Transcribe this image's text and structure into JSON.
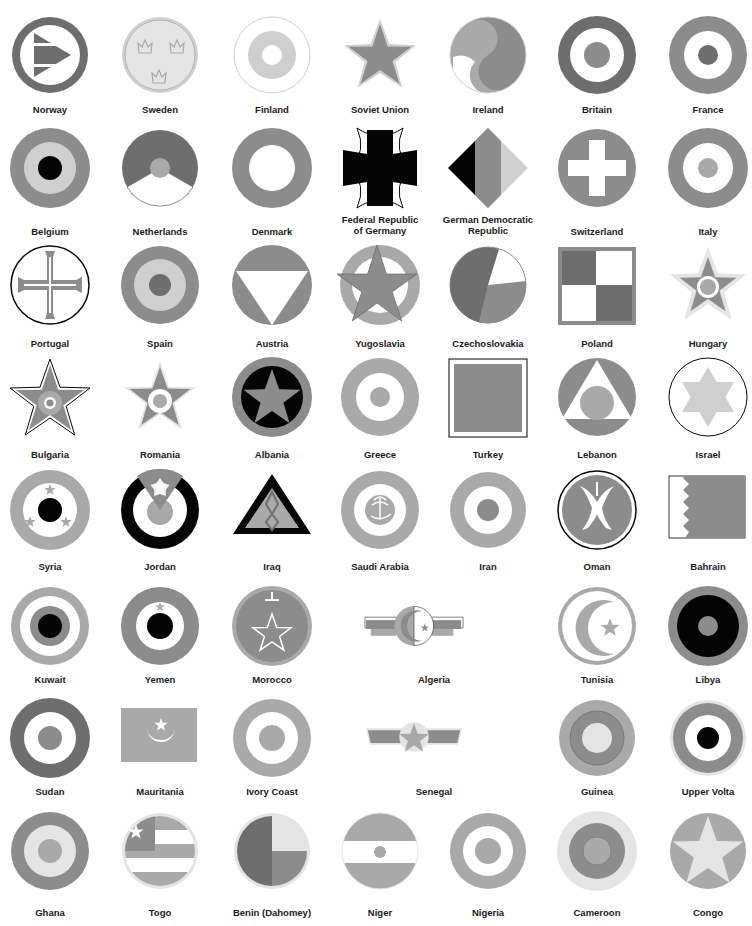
{
  "colors": {
    "dark": "#6e6e6e",
    "mid": "#8c8c8c",
    "light": "#a9a9a9",
    "pale": "#cfcfcf",
    "faint": "#e4e4e4",
    "black": "#050505",
    "white": "#ffffff"
  },
  "roundels": [
    {
      "row": 0,
      "col": 0,
      "label": "Norway",
      "shape": "norway"
    },
    {
      "row": 0,
      "col": 1,
      "label": "Sweden",
      "shape": "sweden"
    },
    {
      "row": 0,
      "col": 2,
      "label": "Finland",
      "shape": "finland"
    },
    {
      "row": 0,
      "col": 3,
      "label": "Soviet Union",
      "shape": "soviet"
    },
    {
      "row": 0,
      "col": 4,
      "label": "Ireland",
      "shape": "ireland"
    },
    {
      "row": 0,
      "col": 5,
      "label": "Britain",
      "shape": "britain"
    },
    {
      "row": 0,
      "col": 6,
      "label": "France",
      "shape": "france"
    },
    {
      "row": 1,
      "col": 0,
      "label": "Belgium",
      "shape": "belgium"
    },
    {
      "row": 1,
      "col": 1,
      "label": "Netherlands",
      "shape": "netherlands"
    },
    {
      "row": 1,
      "col": 2,
      "label": "Denmark",
      "shape": "denmark"
    },
    {
      "row": 1,
      "col": 3,
      "label": "Federal Republic\nof Germany",
      "shape": "frg"
    },
    {
      "row": 1,
      "col": 4,
      "label": "German Democratic\nRepublic",
      "shape": "gdr"
    },
    {
      "row": 1,
      "col": 5,
      "label": "Switzerland",
      "shape": "switzerland"
    },
    {
      "row": 1,
      "col": 6,
      "label": "Italy",
      "shape": "italy"
    },
    {
      "row": 2,
      "col": 0,
      "label": "Portugal",
      "shape": "portugal"
    },
    {
      "row": 2,
      "col": 1,
      "label": "Spain",
      "shape": "spain"
    },
    {
      "row": 2,
      "col": 2,
      "label": "Austria",
      "shape": "austria"
    },
    {
      "row": 2,
      "col": 3,
      "label": "Yugoslavia",
      "shape": "yugoslavia"
    },
    {
      "row": 2,
      "col": 4,
      "label": "Czechoslovakia",
      "shape": "czech"
    },
    {
      "row": 2,
      "col": 5,
      "label": "Poland",
      "shape": "poland"
    },
    {
      "row": 2,
      "col": 6,
      "label": "Hungary",
      "shape": "hungary"
    },
    {
      "row": 3,
      "col": 0,
      "label": "Bulgaria",
      "shape": "bulgaria"
    },
    {
      "row": 3,
      "col": 1,
      "label": "Romania",
      "shape": "romania"
    },
    {
      "row": 3,
      "col": 2,
      "label": "Albania",
      "shape": "albania"
    },
    {
      "row": 3,
      "col": 3,
      "label": "Greece",
      "shape": "greece"
    },
    {
      "row": 3,
      "col": 4,
      "label": "Turkey",
      "shape": "turkey"
    },
    {
      "row": 3,
      "col": 5,
      "label": "Lebanon",
      "shape": "lebanon"
    },
    {
      "row": 3,
      "col": 6,
      "label": "Israel",
      "shape": "israel"
    },
    {
      "row": 4,
      "col": 0,
      "label": "Syria",
      "shape": "syria"
    },
    {
      "row": 4,
      "col": 1,
      "label": "Jordan",
      "shape": "jordan"
    },
    {
      "row": 4,
      "col": 2,
      "label": "Iraq",
      "shape": "iraq"
    },
    {
      "row": 4,
      "col": 3,
      "label": "Saudi Arabia",
      "shape": "saudi"
    },
    {
      "row": 4,
      "col": 4,
      "label": "Iran",
      "shape": "iran"
    },
    {
      "row": 4,
      "col": 5,
      "label": "Oman",
      "shape": "oman"
    },
    {
      "row": 4,
      "col": 6,
      "label": "Bahrain",
      "shape": "bahrain"
    },
    {
      "row": 5,
      "col": 0,
      "label": "Kuwait",
      "shape": "kuwait"
    },
    {
      "row": 5,
      "col": 1,
      "label": "Yemen",
      "shape": "yemen"
    },
    {
      "row": 5,
      "col": 2,
      "label": "Morocco",
      "shape": "morocco"
    },
    {
      "row": 5,
      "col": 3,
      "label": "Algeria",
      "shape": "algeria",
      "span": 2
    },
    {
      "row": 5,
      "col": 5,
      "label": "Tunisia",
      "shape": "tunisia"
    },
    {
      "row": 5,
      "col": 6,
      "label": "Libya",
      "shape": "libya"
    },
    {
      "row": 6,
      "col": 0,
      "label": "Sudan",
      "shape": "sudan"
    },
    {
      "row": 6,
      "col": 1,
      "label": "Mauritania",
      "shape": "mauritania"
    },
    {
      "row": 6,
      "col": 2,
      "label": "Ivory Coast",
      "shape": "ivorycoast"
    },
    {
      "row": 6,
      "col": 3,
      "label": "Senegal",
      "shape": "senegal",
      "span": 2
    },
    {
      "row": 6,
      "col": 5,
      "label": "Guinea",
      "shape": "guinea"
    },
    {
      "row": 6,
      "col": 6,
      "label": "Upper Volta",
      "shape": "uppervolta"
    },
    {
      "row": 7,
      "col": 0,
      "label": "Ghana",
      "shape": "ghana"
    },
    {
      "row": 7,
      "col": 1,
      "label": "Togo",
      "shape": "togo"
    },
    {
      "row": 7,
      "col": 2,
      "label": "Benin (Dahomey)",
      "shape": "benin"
    },
    {
      "row": 7,
      "col": 3,
      "label": "Niger",
      "shape": "niger"
    },
    {
      "row": 7,
      "col": 4,
      "label": "Nigeria",
      "shape": "nigeria"
    },
    {
      "row": 7,
      "col": 5,
      "label": "Cameroon",
      "shape": "cameroon"
    },
    {
      "row": 7,
      "col": 6,
      "label": "Congo",
      "shape": "congo"
    }
  ]
}
